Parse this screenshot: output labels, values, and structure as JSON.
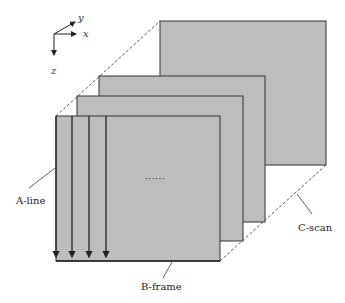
{
  "diagram": {
    "type": "oct-scan-geometry",
    "axes": {
      "x_label": "x",
      "y_label": "y",
      "z_label": "z"
    },
    "labels": {
      "a_line": "A-line",
      "b_frame": "B-frame",
      "c_scan": "C-scan",
      "ellipsis": "······"
    },
    "planes": [
      {
        "name": "back-plane",
        "x": 160,
        "y": 21,
        "w": 166,
        "h": 144
      },
      {
        "name": "plane-3",
        "x": 99,
        "y": 76,
        "w": 166,
        "h": 146
      },
      {
        "name": "plane-2",
        "x": 77,
        "y": 96,
        "w": 166,
        "h": 145
      },
      {
        "name": "front-plane",
        "x": 56,
        "y": 116,
        "w": 164,
        "h": 145
      }
    ],
    "a_line_count": 4,
    "colors": {
      "plane_fill": "#bdbdbd",
      "plane_stroke": "#333333",
      "dashed": "#444444",
      "background": "#ffffff"
    }
  }
}
